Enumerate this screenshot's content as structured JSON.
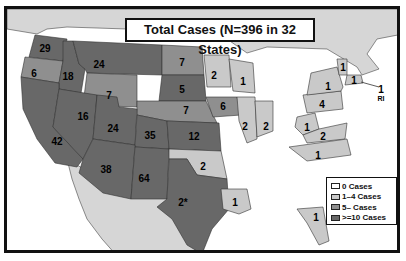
{
  "title": "Total Cases (N=396 in 32 States)",
  "colors": {
    "zero": "#ffffff",
    "low": "#c9c9c9",
    "mid": "#8f8f8f",
    "high": "#686868",
    "foreign": "#d6d6d6",
    "border": "#333333"
  },
  "legend": {
    "items": [
      {
        "label": "0 Cases",
        "color": "#ffffff"
      },
      {
        "label": "1–4 Cases",
        "color": "#c9c9c9"
      },
      {
        "label": "5– Cases",
        "color": "#8f8f8f"
      },
      {
        "label": ">=10 Cases",
        "color": "#686868"
      }
    ]
  },
  "states": [
    {
      "name": "WA",
      "value": "29",
      "x": 38,
      "y": 39
    },
    {
      "name": "OR",
      "value": "6",
      "x": 27,
      "y": 64
    },
    {
      "name": "ID",
      "value": "18",
      "x": 61,
      "y": 67
    },
    {
      "name": "MT",
      "value": "24",
      "x": 92,
      "y": 55
    },
    {
      "name": "ND",
      "value": "7",
      "x": 175,
      "y": 53
    },
    {
      "name": "WY",
      "value": "7",
      "x": 102,
      "y": 86
    },
    {
      "name": "SD",
      "value": "5",
      "x": 175,
      "y": 80
    },
    {
      "name": "NE",
      "value": "7",
      "x": 179,
      "y": 101
    },
    {
      "name": "MN",
      "value": "2",
      "x": 207,
      "y": 66
    },
    {
      "name": "WI",
      "value": "1",
      "x": 236,
      "y": 72
    },
    {
      "name": "IA",
      "value": "6",
      "x": 216,
      "y": 97
    },
    {
      "name": "IL",
      "value": "2",
      "x": 238,
      "y": 117
    },
    {
      "name": "IN",
      "value": "2",
      "x": 259,
      "y": 117
    },
    {
      "name": "NV",
      "value": "16",
      "x": 76,
      "y": 107
    },
    {
      "name": "UT",
      "value": "24",
      "x": 106,
      "y": 119
    },
    {
      "name": "CO",
      "value": "35",
      "x": 143,
      "y": 126
    },
    {
      "name": "KS",
      "value": "12",
      "x": 187,
      "y": 127
    },
    {
      "name": "CA",
      "value": "42",
      "x": 50,
      "y": 132
    },
    {
      "name": "AZ",
      "value": "38",
      "x": 99,
      "y": 160
    },
    {
      "name": "NM",
      "value": "64",
      "x": 137,
      "y": 169
    },
    {
      "name": "OK",
      "value": "2",
      "x": 196,
      "y": 157
    },
    {
      "name": "TX",
      "value": "2*",
      "x": 176,
      "y": 193
    },
    {
      "name": "LA",
      "value": "1",
      "x": 228,
      "y": 193
    },
    {
      "name": "FL",
      "value": "1",
      "x": 309,
      "y": 208
    },
    {
      "name": "NC",
      "value": "1",
      "x": 311,
      "y": 146
    },
    {
      "name": "VA",
      "value": "2",
      "x": 316,
      "y": 127
    },
    {
      "name": "WV",
      "value": "1",
      "x": 300,
      "y": 118
    },
    {
      "name": "PA",
      "value": "4",
      "x": 315,
      "y": 95
    },
    {
      "name": "NY",
      "value": "1",
      "x": 321,
      "y": 77
    },
    {
      "name": "VT",
      "value": "1",
      "x": 336,
      "y": 58
    },
    {
      "name": "MA",
      "value": "1",
      "x": 347,
      "y": 71
    },
    {
      "name": "RI",
      "value": "1",
      "x": 374,
      "y": 80,
      "sub": "RI"
    }
  ]
}
